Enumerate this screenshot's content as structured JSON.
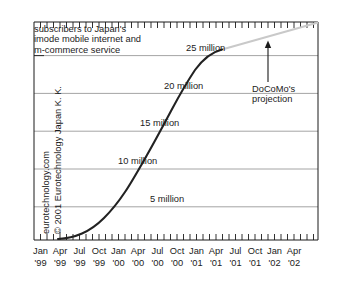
{
  "chart_data": {
    "type": "line",
    "title": "subscribers to Japan's imode mobile internet and m-commerce service",
    "title_lines": [
      "subscribers to Japan's",
      "imode mobile internet and",
      "m-commerce service"
    ],
    "xlabel": "",
    "ylabel": "",
    "ylim": [
      0,
      27.5
    ],
    "ytick_labels": [
      "5 million",
      "10 million",
      "15 million",
      "20 million",
      "25 million"
    ],
    "ytick_values": [
      5,
      10,
      15,
      20,
      25
    ],
    "grid": true,
    "legend": "none",
    "x_categories": [
      {
        "month": "Jan",
        "year": "'99"
      },
      {
        "month": "Apr",
        "year": "'99"
      },
      {
        "month": "Jul",
        "year": "'99"
      },
      {
        "month": "Oct",
        "year": "'99"
      },
      {
        "month": "Jan",
        "year": "'00"
      },
      {
        "month": "Apr",
        "year": "'00"
      },
      {
        "month": "Jul",
        "year": "'00"
      },
      {
        "month": "Oct",
        "year": "'00"
      },
      {
        "month": "Jan",
        "year": "'01"
      },
      {
        "month": "Apr",
        "year": "'01"
      },
      {
        "month": "Jul",
        "year": "'01"
      },
      {
        "month": "Oct",
        "year": "'01"
      },
      {
        "month": "Jan",
        "year": "'02"
      },
      {
        "month": "Apr",
        "year": "'02"
      }
    ],
    "series": [
      {
        "name": "actual subscribers",
        "color": "#222222",
        "style": "solid",
        "points": [
          {
            "x": "Feb '99",
            "y": 0.0
          },
          {
            "x": "Apr '99",
            "y": 0.2
          },
          {
            "x": "Jul '99",
            "y": 0.7
          },
          {
            "x": "Oct '99",
            "y": 1.4
          },
          {
            "x": "Jan '00",
            "y": 2.6
          },
          {
            "x": "Apr '00",
            "y": 4.2
          },
          {
            "x": "Jul '00",
            "y": 6.4
          },
          {
            "x": "Oct '00",
            "y": 9.5
          },
          {
            "x": "Jan '01",
            "y": 13.4
          },
          {
            "x": "Apr '01",
            "y": 17.6
          },
          {
            "x": "Jul '01",
            "y": 21.4
          },
          {
            "x": "Oct '01",
            "y": 24.3
          },
          {
            "x": "Dec '01",
            "y": 25.3
          }
        ]
      },
      {
        "name": "DoCoMo's projection",
        "color": "#c9c9c9",
        "style": "solid",
        "points": [
          {
            "x": "Dec '01",
            "y": 25.3
          },
          {
            "x": "Apr '02",
            "y": 28.5
          }
        ]
      }
    ],
    "annotations": [
      {
        "name": "projection-note",
        "lines": [
          "DoCoMo's",
          "projection"
        ],
        "arrow": "up"
      }
    ],
    "watermarks": {
      "site": "eurotechnology.com",
      "copyright": "© 2001 Eurotechnology Japan K. K."
    },
    "colors": {
      "axis": "#1b1b1b",
      "grid": "#8d8d8d",
      "data_line": "#222222",
      "projection_line": "#c9c9c9",
      "background": "#ffffff",
      "text": "#1b1b1b"
    }
  }
}
